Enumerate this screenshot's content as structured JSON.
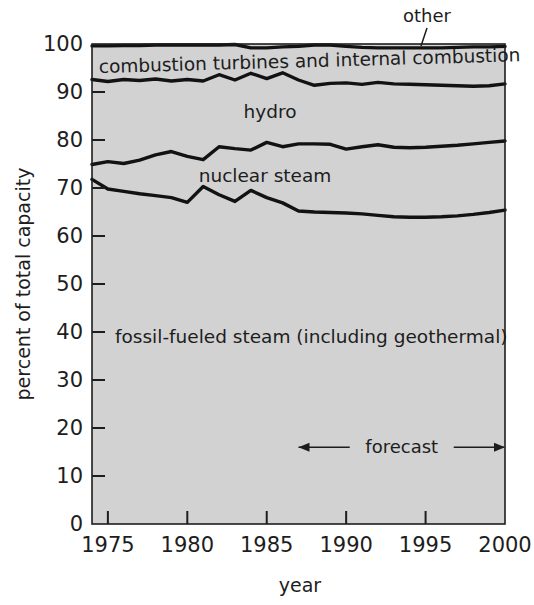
{
  "chart_data": {
    "type": "area",
    "title": "",
    "xlabel": "year",
    "ylabel": "percent of total capacity",
    "xlim": [
      1974,
      2000
    ],
    "ylim": [
      0,
      100
    ],
    "grid": false,
    "legend_position": "inline-labels",
    "stacked": true,
    "x": [
      1974,
      1975,
      1976,
      1977,
      1978,
      1979,
      1980,
      1981,
      1982,
      1983,
      1984,
      1985,
      1986,
      1987,
      1988,
      1989,
      1990,
      1991,
      1992,
      1993,
      1994,
      1995,
      1996,
      1997,
      1998,
      1999,
      2000
    ],
    "series": [
      {
        "name": "fossil-fueled steam (including geothermal)",
        "label": "fossil-fueled steam (including geothermal)",
        "cumulative_top_values": [
          71.8,
          69.8,
          69.3,
          68.8,
          68.4,
          68.0,
          67.0,
          70.3,
          68.6,
          67.2,
          69.5,
          68.0,
          66.9,
          65.2,
          65.0,
          64.9,
          64.8,
          64.6,
          64.3,
          64.0,
          63.9,
          63.9,
          64.0,
          64.2,
          64.5,
          64.9,
          65.4
        ]
      },
      {
        "name": "nuclear steam",
        "label": "nuclear steam",
        "cumulative_top_values": [
          74.9,
          75.5,
          75.1,
          75.8,
          76.9,
          77.6,
          76.6,
          75.9,
          78.6,
          78.2,
          77.9,
          79.5,
          78.6,
          79.2,
          79.2,
          79.1,
          78.1,
          78.6,
          79.0,
          78.5,
          78.4,
          78.5,
          78.7,
          78.9,
          79.2,
          79.5,
          79.8
        ]
      },
      {
        "name": "hydro",
        "label": "hydro",
        "cumulative_top_values": [
          92.6,
          92.2,
          92.6,
          92.4,
          92.7,
          92.3,
          92.6,
          92.3,
          93.6,
          92.5,
          93.9,
          92.8,
          94.0,
          92.5,
          91.4,
          91.8,
          91.9,
          91.6,
          92.0,
          91.7,
          91.6,
          91.5,
          91.4,
          91.3,
          91.2,
          91.3,
          91.7
        ]
      },
      {
        "name": "combustion turbines and internal combustion",
        "label": "combustion turbines and internal combustion",
        "cumulative_top_values": [
          99.6,
          99.6,
          99.7,
          99.7,
          99.8,
          99.8,
          99.8,
          99.8,
          99.8,
          99.9,
          99.2,
          99.2,
          99.4,
          99.5,
          99.8,
          99.8,
          99.5,
          99.3,
          99.2,
          99.2,
          99.2,
          99.2,
          99.2,
          99.3,
          99.4,
          99.4,
          99.5
        ]
      },
      {
        "name": "other",
        "label": "other",
        "cumulative_top_values": [
          100,
          100,
          100,
          100,
          100,
          100,
          100,
          100,
          100,
          100,
          100,
          100,
          100,
          100,
          100,
          100,
          100,
          100,
          100,
          100,
          100,
          100,
          100,
          100,
          100,
          100,
          100
        ]
      }
    ],
    "yticks": [
      0,
      10,
      20,
      30,
      40,
      50,
      60,
      70,
      80,
      90,
      100
    ],
    "yticklabels": [
      "0",
      "10",
      "20",
      "30",
      "40",
      "50",
      "60",
      "70",
      "80",
      "90",
      "100"
    ],
    "xticks": [
      1975,
      1980,
      1985,
      1990,
      1995,
      2000
    ],
    "xticklabels": [
      "1975",
      "1980",
      "1985",
      "1990",
      "1995",
      "2000"
    ],
    "annotations": [
      {
        "text": "forecast",
        "x_start": 1987,
        "x_end": 2000,
        "y": 16,
        "style": "double-arrow"
      }
    ],
    "colors": {
      "plot_fill": "#d2d2d2",
      "line": "#121212",
      "axis": "#1d1d1d",
      "background": "#ffffff",
      "text": "#1d1d1d"
    }
  },
  "labels": {
    "y_axis_title": "percent of total capacity",
    "x_axis_title": "year",
    "other": "other",
    "combustion": "combustion turbines and internal combustion",
    "hydro": "hydro",
    "nuclear": "nuclear steam",
    "fossil": "fossil-fueled steam (including geothermal)",
    "forecast": "forecast"
  },
  "ytick_labels": [
    "0",
    "10",
    "20",
    "30",
    "40",
    "50",
    "60",
    "70",
    "80",
    "90",
    "100"
  ],
  "xtick_labels": [
    "1975",
    "1980",
    "1985",
    "1990",
    "1995",
    "2000"
  ]
}
